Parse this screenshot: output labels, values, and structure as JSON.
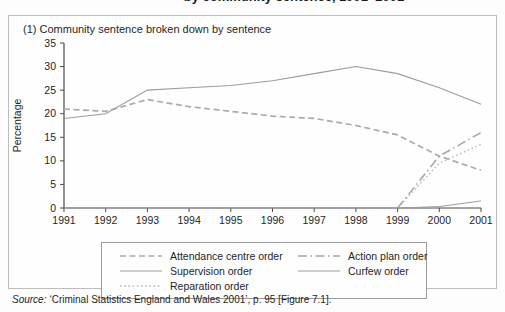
{
  "page": {
    "cropped_title": "by community sentence, 1991–2001"
  },
  "chart_data": {
    "type": "line",
    "title": "(1) Community sentence broken down by sentence",
    "xlabel": "",
    "ylabel": "Percentage",
    "ylim": [
      0,
      35
    ],
    "ytick_step": 5,
    "grid": false,
    "legend_position": "bottom-box",
    "x": [
      1991,
      1992,
      1993,
      1994,
      1995,
      1996,
      1997,
      1998,
      1999,
      2000,
      2001
    ],
    "series": [
      {
        "name": "Attendance centre order",
        "style": "dashed",
        "color": "#ababab",
        "width": 1.7,
        "values": [
          21,
          20.5,
          23,
          21.5,
          20.5,
          19.5,
          19,
          17.5,
          15.5,
          11,
          8
        ]
      },
      {
        "name": "Supervision order",
        "style": "solid",
        "color": "#9c9c9c",
        "width": 1.1,
        "values": [
          19,
          20,
          25,
          25.5,
          26,
          27,
          28.5,
          30,
          28.5,
          25.5,
          22
        ]
      },
      {
        "name": "Reparation order",
        "style": "dotted",
        "color": "#b7b7b7",
        "width": 1.3,
        "values": [
          null,
          null,
          null,
          null,
          null,
          null,
          null,
          null,
          0,
          9.5,
          13.5
        ]
      },
      {
        "name": "Action plan order",
        "style": "dashdot",
        "color": "#a4a4a4",
        "width": 1.5,
        "values": [
          null,
          null,
          null,
          null,
          null,
          null,
          null,
          null,
          0,
          11,
          16
        ]
      },
      {
        "name": "Curfew order",
        "style": "solid",
        "color": "#9c9c9c",
        "width": 1.0,
        "values": [
          0,
          0,
          0,
          0,
          0,
          0,
          0,
          0,
          0,
          0.3,
          1.5
        ]
      }
    ]
  },
  "legend": {
    "order": [
      "Attendance centre order",
      "Action plan order",
      "Supervision order",
      "Curfew order",
      "Reparation order"
    ]
  },
  "source": {
    "label": "Source:",
    "text": "‘Criminal Statistics England and Wales 2001’, p. 95 [Figure 7.1]."
  }
}
